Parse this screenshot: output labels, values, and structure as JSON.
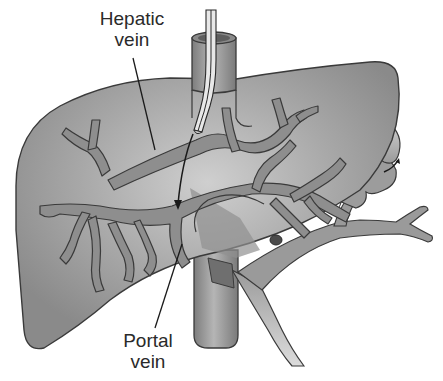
{
  "diagram": {
    "type": "anatomical-illustration",
    "labels": {
      "hepatic_vein": {
        "line1": "Hepatic",
        "line2": "vein"
      },
      "portal_vein": {
        "line1": "Portal",
        "line2": "vein"
      }
    },
    "structures": [
      "liver",
      "hepatic-vein-branches",
      "portal-vein-branches",
      "inferior-vena-cava",
      "catheter",
      "shunt-arrow",
      "splenic-vein",
      "coiled-vessel"
    ],
    "colors": {
      "liver_fill": "#9a9a9a",
      "liver_highlight": "#c8c8c8",
      "vessel_fill": "#8c8c8c",
      "outline": "#3a3a3a",
      "ivc_fill": "#8f8f8f",
      "catheter_fill": "#e6e6e6",
      "background": "#ffffff"
    }
  }
}
